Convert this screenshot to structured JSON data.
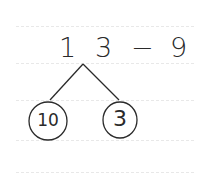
{
  "worksheet": {
    "type": "number-bond",
    "expression": {
      "tens_digit": "1",
      "ones_digit": "3",
      "operator": "−",
      "subtrahend": "9"
    },
    "bond": {
      "left": "10",
      "right": "3"
    },
    "ink_color": "#2a2a2a",
    "rule_color": "#e8e8e8"
  }
}
